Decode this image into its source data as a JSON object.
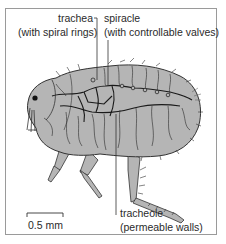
{
  "diagram": {
    "labels": {
      "trachea": {
        "name": "trachea",
        "note": "(with spiral rings)"
      },
      "spiracle": {
        "name": "spiracle",
        "note": "(with controllable valves)"
      },
      "tracheole": {
        "name": "tracheole",
        "note": "(permeable walls)"
      }
    },
    "scale_bar": {
      "label": "0.5 mm"
    },
    "colors": {
      "body_fill": "#b5b5b5",
      "outline": "#333333",
      "trachea_line": "#1a1a1a",
      "frame": "#9a9a9a"
    }
  }
}
